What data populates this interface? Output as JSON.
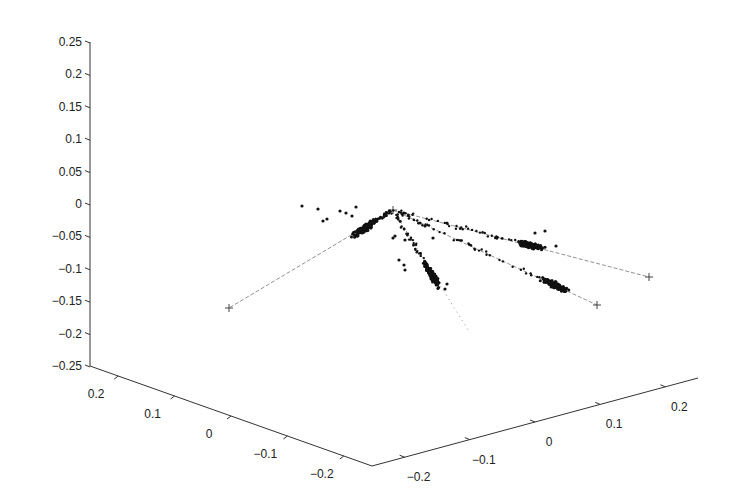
{
  "chart_data": {
    "type": "scatter",
    "dimensions": 3,
    "title": "",
    "xlabel": "",
    "ylabel": "",
    "zlabel": "",
    "grid": false,
    "legend": null,
    "axes": {
      "z": {
        "range": [
          -0.25,
          0.25
        ],
        "ticks": [
          "0.25",
          "0.2",
          "0.15",
          "0.1",
          "0.05",
          "0",
          "-0.05",
          "-0.1",
          "-0.15",
          "-0.2",
          "-0.25"
        ]
      },
      "left_floor": {
        "range": [
          -0.25,
          0.25
        ],
        "ticks": [
          "0.2",
          "0.1",
          "0",
          "-0.1",
          "-0.2"
        ]
      },
      "right_floor": {
        "range": [
          -0.25,
          0.25
        ],
        "ticks": [
          "-0.2",
          "-0.1",
          "0",
          "0.1",
          "0.2"
        ]
      }
    },
    "origin_marker": "+",
    "series": [
      {
        "name": "branch-left",
        "direction_end_marker": "+",
        "description": "cluster near origin extending toward lower-left endpoint",
        "cluster_center_px": [
          365,
          228
        ],
        "end_px": [
          229,
          308
        ]
      },
      {
        "name": "branch-down",
        "description": "dense cluster below origin, dotted line continuing downward",
        "cluster_center_px": [
          432,
          275
        ],
        "end_px": [
          470,
          333
        ]
      },
      {
        "name": "branch-right-upper",
        "direction_end_marker": "+",
        "description": "points along upper-right line",
        "cluster_center_px": [
          530,
          245
        ],
        "end_px": [
          649,
          277
        ]
      },
      {
        "name": "branch-right-lower",
        "direction_end_marker": "+",
        "description": "points along lower-right line",
        "cluster_center_px": [
          555,
          285
        ],
        "end_px": [
          597,
          305
        ]
      }
    ]
  }
}
